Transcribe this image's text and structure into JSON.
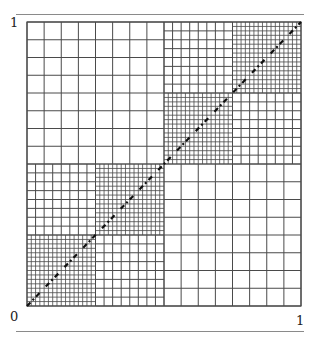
{
  "figure": {
    "labels": {
      "top_left": "1",
      "bottom_left": "0",
      "bottom_right": "1"
    },
    "colors": {
      "grid_line": "#4a4a4a",
      "diagonal": "#111111",
      "rule": "#8a8a8a"
    },
    "blocks": [
      {
        "name": "top-left-quadrant",
        "x0": 0.0,
        "y0": 0.5,
        "size": 0.5,
        "cells": 8,
        "level": "coarse"
      },
      {
        "name": "bottom-right-quadrant",
        "x0": 0.5,
        "y0": 0.0,
        "size": 0.5,
        "cells": 8,
        "level": "coarse"
      },
      {
        "name": "upper-right-offdiag-a",
        "x0": 0.5,
        "y0": 0.75,
        "size": 0.25,
        "cells": 8,
        "level": "medium"
      },
      {
        "name": "upper-right-offdiag-b",
        "x0": 0.75,
        "y0": 0.5,
        "size": 0.25,
        "cells": 8,
        "level": "medium"
      },
      {
        "name": "lower-left-offdiag-a",
        "x0": 0.0,
        "y0": 0.25,
        "size": 0.25,
        "cells": 8,
        "level": "medium"
      },
      {
        "name": "lower-left-offdiag-b",
        "x0": 0.25,
        "y0": 0.0,
        "size": 0.25,
        "cells": 8,
        "level": "medium"
      },
      {
        "name": "diag-block-1",
        "x0": 0.0,
        "y0": 0.0,
        "size": 0.25,
        "cells": 16,
        "level": "fine"
      },
      {
        "name": "diag-block-2",
        "x0": 0.25,
        "y0": 0.25,
        "size": 0.25,
        "cells": 16,
        "level": "fine"
      },
      {
        "name": "diag-block-3",
        "x0": 0.5,
        "y0": 0.5,
        "size": 0.25,
        "cells": 16,
        "level": "fine"
      },
      {
        "name": "diag-block-4",
        "x0": 0.75,
        "y0": 0.75,
        "size": 0.25,
        "cells": 16,
        "level": "fine"
      }
    ]
  }
}
